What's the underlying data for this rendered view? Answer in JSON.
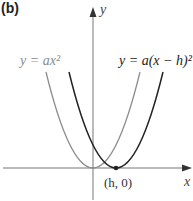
{
  "panel_label": "(b)",
  "axes": {
    "x_label": "x",
    "y_label": "y"
  },
  "curves": [
    {
      "name": "base-parabola",
      "label": "y = ax²",
      "color": "#8c8c8c",
      "vertex": [
        0,
        0
      ]
    },
    {
      "name": "shifted-parabola",
      "label": "y = a(x − h)²",
      "color": "#222222",
      "vertex": [
        "h",
        0
      ]
    }
  ],
  "point_label": "(h, 0)"
}
